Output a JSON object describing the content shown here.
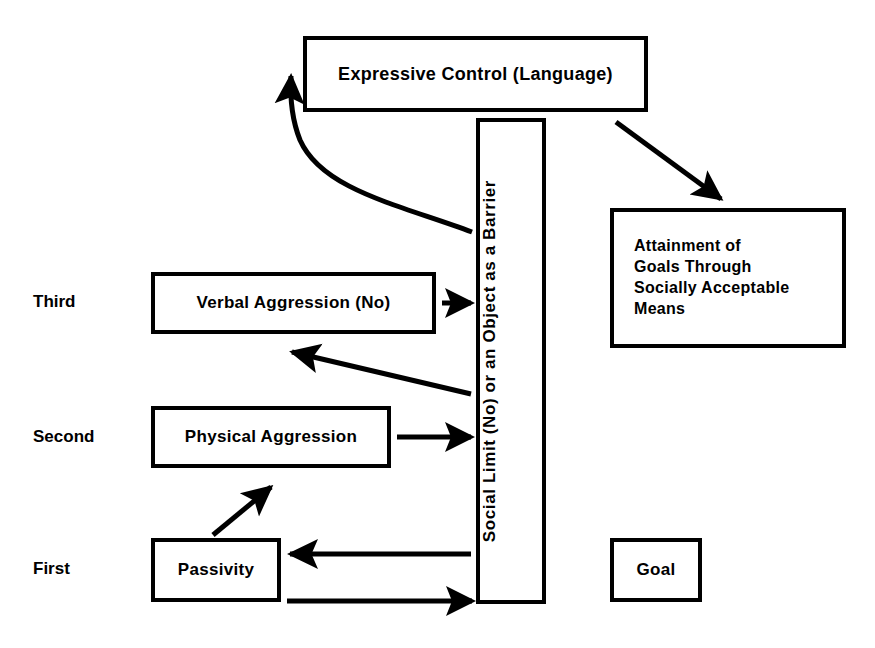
{
  "diagram": {
    "background_color": "#ffffff",
    "line_color": "#000000",
    "stage_labels": [
      {
        "id": "third",
        "text": "Third"
      },
      {
        "id": "second",
        "text": "Second"
      },
      {
        "id": "first",
        "text": "First"
      }
    ],
    "nodes": [
      {
        "id": "expressive",
        "text": "Expressive Control (Language)"
      },
      {
        "id": "barrier",
        "text": "Social Limit (No) or an Object as a Barrier"
      },
      {
        "id": "attainment",
        "lines": [
          "Attainment of",
          "Goals Through",
          "Socially Acceptable",
          "Means"
        ]
      },
      {
        "id": "verbal",
        "text": "Verbal Aggression (No)"
      },
      {
        "id": "physical",
        "text": "Physical Aggression"
      },
      {
        "id": "passivity",
        "text": "Passivity"
      },
      {
        "id": "goal",
        "text": "Goal"
      }
    ],
    "connectors": [
      {
        "id": "barrier-to-expressive",
        "type": "curve",
        "from": "barrier",
        "to": "expressive",
        "arrowhead": "end"
      },
      {
        "id": "expressive-to-attainment",
        "type": "diagonal",
        "from": "expressive",
        "to": "attainment",
        "arrowhead": "end"
      },
      {
        "id": "verbal-to-barrier",
        "type": "straight",
        "from": "verbal",
        "to": "barrier",
        "arrowhead": "end"
      },
      {
        "id": "barrier-to-verbal",
        "type": "diagonal",
        "from": "barrier",
        "to": "verbal",
        "arrowhead": "end"
      },
      {
        "id": "physical-to-barrier",
        "type": "straight",
        "from": "physical",
        "to": "barrier",
        "arrowhead": "end"
      },
      {
        "id": "passivity-to-physical",
        "type": "diagonal",
        "from": "passivity",
        "to": "physical",
        "arrowhead": "end"
      },
      {
        "id": "barrier-to-passivity",
        "type": "straight",
        "from": "barrier",
        "to": "passivity",
        "arrowhead": "end"
      },
      {
        "id": "passivity-to-barrier",
        "type": "straight",
        "from": "passivity",
        "to": "barrier",
        "arrowhead": "end"
      }
    ]
  }
}
